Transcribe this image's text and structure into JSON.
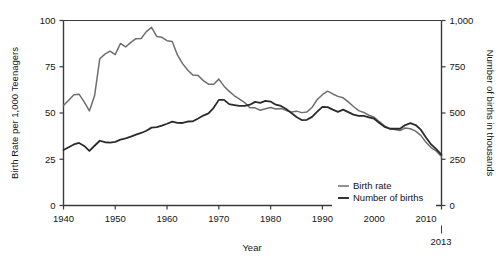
{
  "chart_data": {
    "type": "line",
    "title": "",
    "xlabel": "Year",
    "ylabel": "Birth Rate per 1,000 Teenagers",
    "y2label": "Number of births in thousands",
    "xlim": [
      1940,
      2013
    ],
    "ylim": [
      0,
      100
    ],
    "y2lim": [
      0,
      1000
    ],
    "grid": false,
    "legend_position": "bottom-right",
    "xticks": [
      "1940",
      "1950",
      "1960",
      "1970",
      "1980",
      "1990",
      "2000",
      "2010"
    ],
    "xtick_values": [
      1940,
      1950,
      1960,
      1970,
      1980,
      1990,
      2000,
      2010
    ],
    "yticks": [
      "0",
      "25",
      "50",
      "75",
      "100"
    ],
    "ytick_values": [
      0,
      25,
      50,
      75,
      100
    ],
    "y2ticks": [
      "0",
      "250",
      "500",
      "750",
      "1,000"
    ],
    "y2tick_values": [
      0,
      250,
      500,
      750,
      1000
    ],
    "end_annotation": "2013",
    "x": [
      1940,
      1941,
      1942,
      1943,
      1944,
      1945,
      1946,
      1947,
      1948,
      1949,
      1950,
      1951,
      1952,
      1953,
      1954,
      1955,
      1956,
      1957,
      1958,
      1959,
      1960,
      1961,
      1962,
      1963,
      1964,
      1965,
      1966,
      1967,
      1968,
      1969,
      1970,
      1971,
      1972,
      1973,
      1974,
      1975,
      1976,
      1977,
      1978,
      1979,
      1980,
      1981,
      1982,
      1983,
      1984,
      1985,
      1986,
      1987,
      1988,
      1989,
      1990,
      1991,
      1992,
      1993,
      1994,
      1995,
      1996,
      1997,
      1998,
      1999,
      2000,
      2001,
      2002,
      2003,
      2004,
      2005,
      2006,
      2007,
      2008,
      2009,
      2010,
      2011,
      2012,
      2013
    ],
    "series": [
      {
        "name": "Birth rate",
        "color": "#6e6e6e",
        "axis": "left",
        "units": "births per 1,000 teenagers",
        "values": [
          54.1,
          56.9,
          59.9,
          60.2,
          56.0,
          51.1,
          59.3,
          79.3,
          81.8,
          83.4,
          81.6,
          87.6,
          85.7,
          88.2,
          90.2,
          90.3,
          94.0,
          96.3,
          91.4,
          90.9,
          89.1,
          88.6,
          81.4,
          76.7,
          73.1,
          70.5,
          70.3,
          67.5,
          65.6,
          65.5,
          68.3,
          64.5,
          61.7,
          59.3,
          57.5,
          55.6,
          52.8,
          52.8,
          51.5,
          52.3,
          53.0,
          52.2,
          52.4,
          51.4,
          50.6,
          51.0,
          50.2,
          50.6,
          53.0,
          57.3,
          59.9,
          61.8,
          60.3,
          59.0,
          58.2,
          56.0,
          53.5,
          51.3,
          50.3,
          48.8,
          47.7,
          45.3,
          43.0,
          41.6,
          41.1,
          40.5,
          41.9,
          41.5,
          40.2,
          37.9,
          34.2,
          31.3,
          29.4,
          26.5
        ]
      },
      {
        "name": "Number of births",
        "color": "#2b2b2b",
        "axis": "right",
        "units": "thousands of births",
        "values": [
          300,
          315,
          330,
          338,
          322,
          295,
          323,
          350,
          342,
          340,
          344,
          356,
          363,
          372,
          383,
          392,
          404,
          421,
          424,
          432,
          442,
          453,
          447,
          446,
          454,
          455,
          470,
          486,
          498,
          528,
          571,
          571,
          548,
          543,
          538,
          539,
          545,
          560,
          555,
          566,
          562,
          545,
          538,
          522,
          500,
          478,
          462,
          463,
          479,
          507,
          533,
          532,
          518,
          506,
          518,
          505,
          491,
          484,
          485,
          477,
          469,
          446,
          425,
          415,
          415,
          415,
          435,
          445,
          435,
          410,
          368,
          330,
          305,
          274
        ]
      }
    ]
  },
  "legend": {
    "items": [
      {
        "label": "Birth rate",
        "color": "#6e6e6e"
      },
      {
        "label": "Number of births",
        "color": "#2b2b2b"
      }
    ]
  },
  "axes": {
    "left_title": "Birth Rate per 1,000 Teenagers",
    "right_title": "Number of births in thousands",
    "bottom_title": "Year",
    "end_year_note": "2013"
  }
}
